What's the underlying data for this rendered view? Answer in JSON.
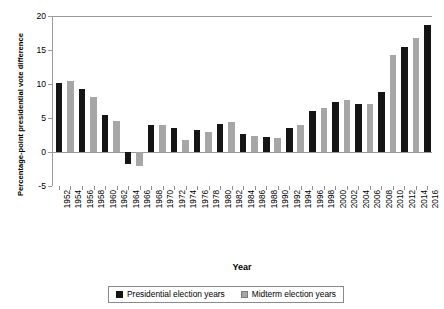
{
  "chart_data": {
    "type": "bar",
    "title": "",
    "xlabel": "Year",
    "ylabel": "Percentage-point presidential vote difference",
    "ylim": [
      -5,
      20
    ],
    "yticks": [
      -5,
      0,
      5,
      10,
      15,
      20
    ],
    "grid": false,
    "legend_position": "bottom",
    "categories": [
      "1952",
      "1954",
      "1956",
      "1958",
      "1960",
      "1962",
      "1964",
      "1966",
      "1968",
      "1970",
      "1972",
      "1974",
      "1976",
      "1978",
      "1980",
      "1982",
      "1984",
      "1986",
      "1988",
      "1990",
      "1992",
      "1994",
      "1996",
      "1998",
      "2000",
      "2002",
      "2004",
      "2006",
      "2008",
      "2010",
      "2012",
      "2014",
      "2016"
    ],
    "series": [
      {
        "name": "Presidential election years",
        "color": "#151515",
        "values": [
          10.2,
          null,
          9.2,
          null,
          5.4,
          null,
          -1.7,
          null,
          4.0,
          null,
          3.5,
          null,
          3.2,
          null,
          4.1,
          null,
          2.7,
          null,
          2.2,
          null,
          3.6,
          null,
          6.1,
          null,
          7.4,
          null,
          7.0,
          null,
          8.8,
          null,
          15.5,
          null,
          18.7
        ]
      },
      {
        "name": "Midterm election years",
        "color": "#a6a6a6",
        "values": [
          null,
          10.4,
          null,
          8.1,
          null,
          4.6,
          null,
          -2.0,
          null,
          4.0,
          null,
          1.7,
          null,
          3.0,
          null,
          4.4,
          null,
          2.4,
          null,
          2.0,
          null,
          3.9,
          null,
          6.4,
          null,
          7.6,
          null,
          7.1,
          null,
          14.2,
          null,
          16.8,
          null
        ]
      }
    ],
    "bars": [
      {
        "year": "1952",
        "group": "presidential",
        "value": 10.2
      },
      {
        "year": "1954",
        "group": "midterm",
        "value": 10.4
      },
      {
        "year": "1956",
        "group": "presidential",
        "value": 9.2
      },
      {
        "year": "1958",
        "group": "midterm",
        "value": 8.1
      },
      {
        "year": "1960",
        "group": "presidential",
        "value": 5.4
      },
      {
        "year": "1962",
        "group": "midterm",
        "value": 4.6
      },
      {
        "year": "1964",
        "group": "presidential",
        "value": -1.7
      },
      {
        "year": "1966",
        "group": "midterm",
        "value": -2.0
      },
      {
        "year": "1968",
        "group": "presidential",
        "value": 4.0
      },
      {
        "year": "1970",
        "group": "midterm",
        "value": 4.0
      },
      {
        "year": "1972",
        "group": "presidential",
        "value": 3.5
      },
      {
        "year": "1974",
        "group": "midterm",
        "value": 1.7
      },
      {
        "year": "1976",
        "group": "presidential",
        "value": 3.2
      },
      {
        "year": "1978",
        "group": "midterm",
        "value": 3.0
      },
      {
        "year": "1980",
        "group": "presidential",
        "value": 4.1
      },
      {
        "year": "1982",
        "group": "midterm",
        "value": 4.4
      },
      {
        "year": "1984",
        "group": "presidential",
        "value": 2.7
      },
      {
        "year": "1986",
        "group": "midterm",
        "value": 2.4
      },
      {
        "year": "1988",
        "group": "presidential",
        "value": 2.2
      },
      {
        "year": "1990",
        "group": "midterm",
        "value": 2.0
      },
      {
        "year": "1992",
        "group": "presidential",
        "value": 3.6
      },
      {
        "year": "1994",
        "group": "midterm",
        "value": 3.9
      },
      {
        "year": "1996",
        "group": "presidential",
        "value": 6.1
      },
      {
        "year": "1998",
        "group": "midterm",
        "value": 6.4
      },
      {
        "year": "2000",
        "group": "presidential",
        "value": 7.4
      },
      {
        "year": "2002",
        "group": "midterm",
        "value": 7.6
      },
      {
        "year": "2004",
        "group": "presidential",
        "value": 7.0
      },
      {
        "year": "2006",
        "group": "midterm",
        "value": 7.1
      },
      {
        "year": "2008",
        "group": "presidential",
        "value": 8.8
      },
      {
        "year": "2010",
        "group": "midterm",
        "value": 14.2
      },
      {
        "year": "2012",
        "group": "presidential",
        "value": 15.5
      },
      {
        "year": "2014",
        "group": "midterm",
        "value": 16.8
      },
      {
        "year": "2016",
        "group": "presidential",
        "value": 18.7
      }
    ]
  },
  "legend": {
    "items": [
      {
        "label": "Presidential election years",
        "swatch": "pres"
      },
      {
        "label": "Midterm election years",
        "swatch": "mid"
      }
    ]
  }
}
